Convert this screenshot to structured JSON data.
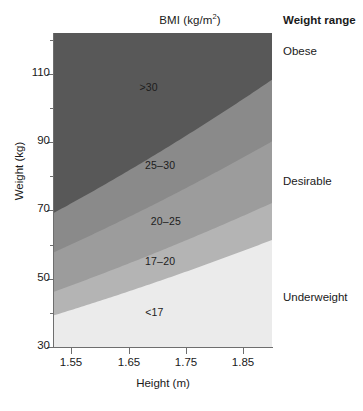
{
  "chart_data": {
    "type": "area",
    "title_base": "BMI (kg/m",
    "title_sup": "2",
    "title_close": ")",
    "xlabel": "Height (m)",
    "ylabel": "Weight (kg)",
    "xlim": [
      1.52,
      1.9
    ],
    "ylim": [
      30,
      122
    ],
    "grid": false,
    "x_ticks": [
      "1.55",
      "1.65",
      "1.75",
      "1.85"
    ],
    "x_tick_values": [
      1.55,
      1.65,
      1.75,
      1.85
    ],
    "y_ticks": [
      "110",
      "90",
      "70",
      "50",
      "30"
    ],
    "y_tick_values": [
      110,
      90,
      70,
      50,
      30
    ],
    "y_minor_values": [
      120,
      100,
      80,
      60,
      40
    ],
    "bands": [
      {
        "label": ">30",
        "bmi_min": 30,
        "bmi_max": null,
        "color": "#585858",
        "label_x": 1.685,
        "label_y": 106
      },
      {
        "label": "25–30",
        "bmi_min": 25,
        "bmi_max": 30,
        "color": "#8a8a8a",
        "label_x": 1.705,
        "label_y": 83
      },
      {
        "label": "20–25",
        "bmi_min": 20,
        "bmi_max": 25,
        "color": "#9c9c9c",
        "label_x": 1.715,
        "label_y": 66.5
      },
      {
        "label": "17–20",
        "bmi_min": 17,
        "bmi_max": 20,
        "color": "#b4b4b4",
        "label_x": 1.705,
        "label_y": 55
      },
      {
        "label": "<17",
        "bmi_min": null,
        "bmi_max": 17,
        "color": "#ebebeb",
        "label_x": 1.695,
        "label_y": 40
      }
    ]
  },
  "legend": {
    "title": "Weight range",
    "entries": [
      {
        "label": "Obese",
        "y_weight": 116
      },
      {
        "label": "Desirable",
        "y_weight": 78
      },
      {
        "label": "Underweight",
        "y_weight": 44
      }
    ]
  }
}
